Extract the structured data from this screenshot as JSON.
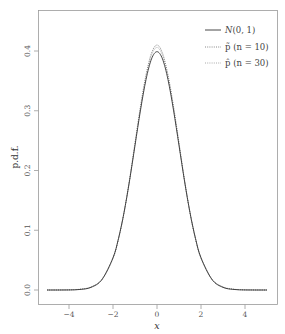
{
  "chart_data": {
    "type": "line",
    "title": "",
    "xlabel": "x",
    "ylabel": "p.d.f.",
    "xlim": [
      -5.3,
      5.3
    ],
    "ylim": [
      -0.018,
      0.468
    ],
    "xticks": [
      -4,
      -2,
      0,
      2,
      4
    ],
    "xtick_labels": [
      "−4",
      "−2",
      "0",
      "2",
      "4"
    ],
    "yticks": [
      0.0,
      0.1,
      0.2,
      0.3,
      0.4
    ],
    "ytick_labels": [
      "0.0",
      "0.1",
      "0.2",
      "0.3",
      "0.4"
    ],
    "grid": false,
    "legend_position": "top-right",
    "x": [
      -5,
      -4.5,
      -4,
      -3.5,
      -3,
      -2.5,
      -2,
      -1.75,
      -1.5,
      -1.25,
      -1,
      -0.75,
      -0.5,
      -0.25,
      0,
      0.25,
      0.5,
      0.75,
      1,
      1.25,
      1.5,
      1.75,
      2,
      2.5,
      3,
      3.5,
      4,
      4.5,
      5
    ],
    "series": [
      {
        "name": "N(0, 1)",
        "style": "solid",
        "color": "#333333",
        "values": [
          0.0,
          0.0,
          0.0001,
          0.0009,
          0.0044,
          0.0175,
          0.054,
          0.0863,
          0.1295,
          0.1826,
          0.242,
          0.3011,
          0.3521,
          0.3867,
          0.3989,
          0.3867,
          0.3521,
          0.3011,
          0.242,
          0.1826,
          0.1295,
          0.0863,
          0.054,
          0.0175,
          0.0044,
          0.0009,
          0.0001,
          0.0,
          0.0
        ]
      },
      {
        "name": "p̃ (n = 10)",
        "style": "dotted",
        "color": "#888888",
        "values": [
          0.0,
          0.0001,
          0.0003,
          0.0013,
          0.0052,
          0.018,
          0.053,
          0.085,
          0.129,
          0.184,
          0.246,
          0.3075,
          0.36,
          0.3965,
          0.41,
          0.3965,
          0.36,
          0.3075,
          0.246,
          0.184,
          0.129,
          0.085,
          0.053,
          0.018,
          0.0052,
          0.0013,
          0.0003,
          0.0001,
          0.0
        ]
      },
      {
        "name": "p̂ (n = 30)",
        "style": "dotted",
        "color": "#aaaaaa",
        "values": [
          0.0,
          0.0,
          0.0002,
          0.0011,
          0.0048,
          0.0178,
          0.0535,
          0.0856,
          0.1292,
          0.1833,
          0.2445,
          0.305,
          0.357,
          0.393,
          0.406,
          0.393,
          0.357,
          0.305,
          0.2445,
          0.1833,
          0.1292,
          0.0856,
          0.0535,
          0.0178,
          0.0048,
          0.0011,
          0.0002,
          0.0,
          0.0
        ]
      }
    ]
  },
  "legend": {
    "items": [
      {
        "label": "N(0, 1)"
      },
      {
        "label": "p̃ (n = 10)"
      },
      {
        "label": "p̂ (n = 30)"
      }
    ]
  },
  "axes": {
    "x_title": "x",
    "y_title": "p.d.f.",
    "x_ticks": [
      "−4",
      "−2",
      "0",
      "2",
      "4"
    ],
    "y_ticks": [
      "0.0",
      "0.1",
      "0.2",
      "0.3",
      "0.4"
    ]
  }
}
